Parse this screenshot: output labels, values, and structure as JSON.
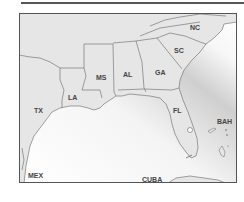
{
  "map": {
    "frame_color": "#555555",
    "land_color": "#e6e6e6",
    "border_color": "#666666",
    "water_light": "#ffffff",
    "water_dark": "#cfcfcf",
    "labels": {
      "nc": "NC",
      "sc": "SC",
      "ga": "GA",
      "al": "AL",
      "ms": "MS",
      "la": "LA",
      "tx": "TX",
      "fl": "FL",
      "bah": "BAH",
      "mex": "MEX",
      "cuba": "CUBA"
    }
  }
}
